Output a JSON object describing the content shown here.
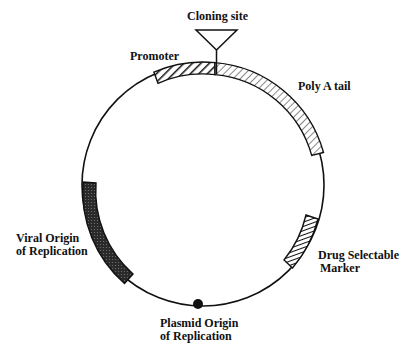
{
  "diagram": {
    "type": "plasmid-map",
    "labels": {
      "cloning_site": "Cloning site",
      "promoter": "Promoter",
      "poly_a_tail": "Poly A tail",
      "viral_origin_line1": "Viral Origin",
      "viral_origin_line2": "of Replication",
      "drug_marker_line1": "Drug Selectable",
      "drug_marker_line2": "Marker",
      "plasmid_origin_line1": "Plasmid Origin",
      "plasmid_origin_line2": "of Replication"
    },
    "colors": {
      "stroke": "#111111",
      "background": "#ffffff",
      "viral_origin_fill": "#333333"
    }
  }
}
